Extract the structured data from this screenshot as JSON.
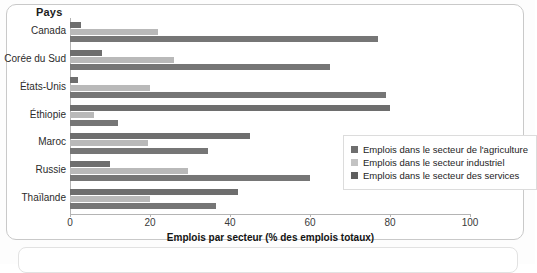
{
  "chart_data": {
    "type": "bar",
    "orientation": "horizontal",
    "title": "",
    "xlabel": "Emplois par secteur (% des emplois totaux)",
    "ylabel": "Pays",
    "xlim": [
      0,
      100
    ],
    "xticks": [
      0,
      20,
      40,
      60,
      80,
      100
    ],
    "grid": false,
    "legend_position": "right",
    "categories": [
      "Canada",
      "Corée du Sud",
      "États-Unis",
      "Éthiopie",
      "Maroc",
      "Russie",
      "Thaïlande"
    ],
    "series": [
      {
        "name": "Emplois dans le secteur de l'agriculture",
        "color": "#6e6e6e",
        "values": [
          2.7,
          8,
          2,
          80,
          45,
          10,
          42
        ]
      },
      {
        "name": "Emplois dans le secteur industriel",
        "color": "#b9b9b9",
        "values": [
          22,
          26,
          20,
          6,
          19.5,
          29.5,
          20
        ]
      },
      {
        "name": "Emplois dans le secteur des services",
        "color": "#767676",
        "values": [
          77,
          65,
          79,
          12,
          34.5,
          60,
          36.5
        ]
      }
    ]
  },
  "axes": {
    "y_title": "Pays",
    "x_title": "Emplois par secteur (% des emplois totaux)",
    "x_tick_labels": [
      "0",
      "20",
      "40",
      "60",
      "80",
      "100"
    ],
    "y_tick_labels": [
      "Canada",
      "Corée du Sud",
      "États-Unis",
      "Éthiopie",
      "Maroc",
      "Russie",
      "Thaïlande"
    ]
  },
  "legend": {
    "items": [
      {
        "label": "Emplois dans le secteur de l'agriculture",
        "swatch": "agri"
      },
      {
        "label": "Emplois dans le secteur industriel",
        "swatch": "indu"
      },
      {
        "label": "Emplois dans le secteur des services",
        "swatch": "serv"
      }
    ]
  }
}
